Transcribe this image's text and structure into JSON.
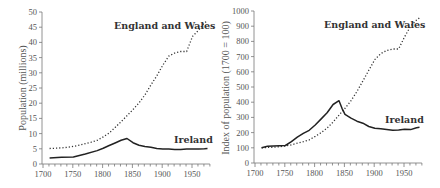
{
  "chart_data": [
    {
      "type": "line",
      "title": "",
      "xlabel": "",
      "ylabel": "Population (millions)",
      "xlim": [
        1700,
        1980
      ],
      "ylim": [
        0,
        50
      ],
      "x_ticks": [
        1700,
        1750,
        1800,
        1850,
        1900,
        1950
      ],
      "y_ticks": [
        0,
        5,
        10,
        15,
        20,
        25,
        30,
        35,
        40,
        45,
        50
      ],
      "grid": false,
      "legend": "inline labels",
      "series": [
        {
          "name": "England and Wales",
          "style": "dotted",
          "x": [
            1711,
            1721,
            1731,
            1741,
            1751,
            1761,
            1771,
            1781,
            1791,
            1801,
            1811,
            1821,
            1831,
            1841,
            1851,
            1861,
            1871,
            1881,
            1891,
            1901,
            1911,
            1921,
            1931,
            1941,
            1951,
            1961,
            1971,
            1976
          ],
          "values": [
            5.1,
            5.2,
            5.3,
            5.5,
            5.8,
            6.2,
            6.7,
            7.2,
            7.8,
            8.9,
            10.2,
            12.0,
            13.9,
            15.9,
            17.9,
            20.1,
            22.7,
            26.0,
            29.0,
            32.5,
            35.5,
            36.5,
            37.0,
            37.0,
            42.0,
            44.0,
            46.5,
            47.0
          ]
        },
        {
          "name": "Ireland",
          "style": "solid",
          "x": [
            1711,
            1731,
            1751,
            1771,
            1791,
            1801,
            1811,
            1821,
            1831,
            1841,
            1851,
            1861,
            1871,
            1881,
            1891,
            1901,
            1911,
            1921,
            1931,
            1941,
            1951,
            1961,
            1971,
            1976
          ],
          "values": [
            2.0,
            2.2,
            2.3,
            3.3,
            4.4,
            5.2,
            6.1,
            6.9,
            7.8,
            8.4,
            7.0,
            6.2,
            5.8,
            5.5,
            5.1,
            4.9,
            4.9,
            4.8,
            4.8,
            4.9,
            4.9,
            4.9,
            5.0,
            5.1
          ]
        }
      ]
    },
    {
      "type": "line",
      "title": "",
      "xlabel": "",
      "ylabel": "Index of population (1700 = 100)",
      "xlim": [
        1700,
        1980
      ],
      "ylim": [
        0,
        1000
      ],
      "x_ticks": [
        1700,
        1750,
        1800,
        1850,
        1900,
        1950
      ],
      "y_ticks": [
        0,
        100,
        200,
        300,
        400,
        500,
        600,
        700,
        800,
        900,
        1000
      ],
      "grid": false,
      "legend": "inline labels",
      "series": [
        {
          "name": "England and Wales",
          "style": "dotted",
          "x": [
            1711,
            1721,
            1731,
            1741,
            1751,
            1761,
            1771,
            1781,
            1791,
            1801,
            1811,
            1821,
            1831,
            1841,
            1851,
            1861,
            1871,
            1881,
            1891,
            1901,
            1911,
            1921,
            1931,
            1941,
            1951,
            1961,
            1971,
            1976
          ],
          "values": [
            100,
            102,
            104,
            107,
            112,
            120,
            130,
            140,
            152,
            175,
            200,
            230,
            270,
            315,
            360,
            410,
            470,
            540,
            610,
            680,
            720,
            740,
            750,
            750,
            830,
            900,
            940,
            955
          ]
        },
        {
          "name": "Ireland",
          "style": "solid",
          "x": [
            1711,
            1721,
            1731,
            1741,
            1751,
            1761,
            1771,
            1781,
            1791,
            1801,
            1811,
            1821,
            1831,
            1841,
            1846,
            1851,
            1861,
            1871,
            1881,
            1891,
            1901,
            1911,
            1921,
            1931,
            1941,
            1951,
            1961,
            1971,
            1976
          ],
          "values": [
            100,
            110,
            112,
            113,
            115,
            140,
            170,
            195,
            215,
            250,
            290,
            330,
            385,
            410,
            360,
            320,
            295,
            275,
            262,
            240,
            228,
            225,
            220,
            215,
            218,
            222,
            220,
            232,
            235
          ]
        }
      ]
    }
  ],
  "left_chart": {
    "ylabel": "Population (millions)",
    "label_ew": "England and Wales",
    "label_ireland": "Ireland"
  },
  "right_chart": {
    "ylabel": "Index of population (1700 = 100)",
    "label_ew": "England and Wales",
    "label_ireland": "Ireland"
  }
}
